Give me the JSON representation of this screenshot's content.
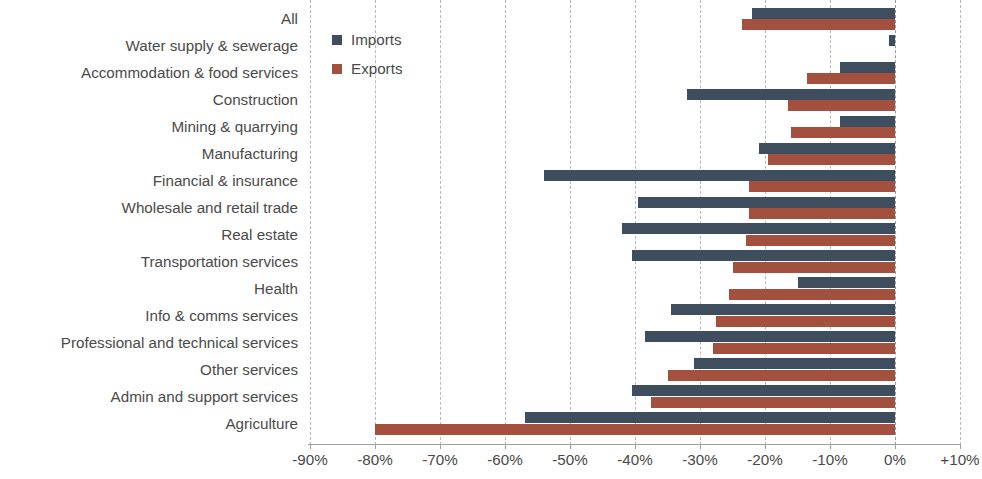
{
  "chart_data": {
    "type": "bar",
    "orientation": "horizontal",
    "title": "",
    "subtitle": "",
    "xlabel": "",
    "ylabel": "",
    "grid": true,
    "xlim": [
      -90,
      10
    ],
    "xticks": [
      -90,
      -80,
      -70,
      -60,
      -50,
      -40,
      -30,
      -20,
      -10,
      0,
      10
    ],
    "xtick_labels": [
      "-90%",
      "-80%",
      "-70%",
      "-60%",
      "-50%",
      "-40%",
      "-30%",
      "-20%",
      "-10%",
      "0%",
      "+10%"
    ],
    "legend_position": "top-left-inside",
    "categories": [
      "All",
      "Water supply & sewerage",
      "Accommodation & food services",
      "Construction",
      "Mining & quarrying",
      "Manufacturing",
      "Financial & insurance",
      "Wholesale and retail trade",
      "Real estate",
      "Transportation services",
      "Health",
      "Info & comms services",
      "Professional and technical services",
      "Other services",
      "Admin and support services",
      "Agriculture"
    ],
    "series": [
      {
        "name": "Imports",
        "color": "#3e4e5e",
        "values": [
          -22.0,
          -1.0,
          -8.5,
          -32.0,
          -8.5,
          -21.0,
          -54.0,
          -39.5,
          -42.0,
          -40.5,
          -15.0,
          -34.5,
          -38.5,
          -31.0,
          -40.5,
          -57.0
        ]
      },
      {
        "name": "Exports",
        "color": "#a4503f",
        "values": [
          -23.5,
          0.0,
          -13.5,
          -16.5,
          -16.0,
          -19.5,
          -22.5,
          -22.5,
          -23.0,
          -25.0,
          -25.5,
          -27.5,
          -28.0,
          -35.0,
          -37.5,
          -80.0
        ]
      }
    ]
  },
  "legend": {
    "entries": [
      {
        "label": "Imports",
        "key": "imports"
      },
      {
        "label": "Exports",
        "key": "exports"
      }
    ]
  },
  "colors": {
    "imports": "#3e4e5e",
    "exports": "#a4503f",
    "gridline": "#b9b9b9",
    "axis": "#9f9f9f",
    "text": "#4a4a4a",
    "background": "#ffffff"
  }
}
